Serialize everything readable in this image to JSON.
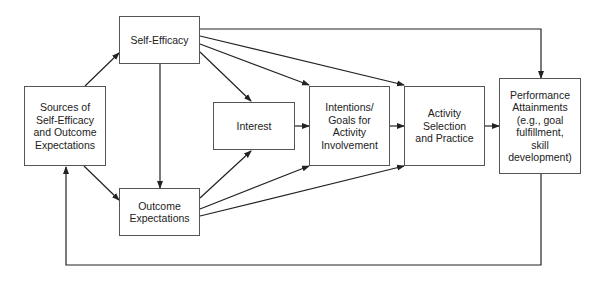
{
  "diagram": {
    "type": "flowchart",
    "colors": {
      "line": "#222222",
      "border": "#555555",
      "text": "#222222",
      "background": "#ffffff"
    },
    "nodes": {
      "sources": {
        "label": "Sources of\nSelf-Efficacy\nand Outcome\nExpectations"
      },
      "self_efficacy": {
        "label": "Self-Efficacy"
      },
      "outcome_expectations": {
        "label": "Outcome\nExpectations"
      },
      "interest": {
        "label": "Interest"
      },
      "intentions": {
        "label": "Intentions/\nGoals for\nActivity\nInvolvement"
      },
      "activity": {
        "label": "Activity\nSelection\nand Practice"
      },
      "performance": {
        "label": "Performance\nAttainments\n(e.g., goal\nfulfillment,\nskill\ndevelopment)"
      }
    },
    "edges": [
      {
        "from": "Sources of Self-Efficacy and Outcome Expectations",
        "to": "Self-Efficacy"
      },
      {
        "from": "Sources of Self-Efficacy and Outcome Expectations",
        "to": "Outcome Expectations"
      },
      {
        "from": "Self-Efficacy",
        "to": "Outcome Expectations"
      },
      {
        "from": "Self-Efficacy",
        "to": "Interest"
      },
      {
        "from": "Self-Efficacy",
        "to": "Intentions/Goals for Activity Involvement"
      },
      {
        "from": "Self-Efficacy",
        "to": "Activity Selection and Practice"
      },
      {
        "from": "Self-Efficacy",
        "to": "Performance Attainments"
      },
      {
        "from": "Outcome Expectations",
        "to": "Interest"
      },
      {
        "from": "Outcome Expectations",
        "to": "Intentions/Goals for Activity Involvement"
      },
      {
        "from": "Outcome Expectations",
        "to": "Activity Selection and Practice"
      },
      {
        "from": "Interest",
        "to": "Intentions/Goals for Activity Involvement"
      },
      {
        "from": "Intentions/Goals for Activity Involvement",
        "to": "Activity Selection and Practice"
      },
      {
        "from": "Activity Selection and Practice",
        "to": "Performance Attainments"
      },
      {
        "from": "Performance Attainments",
        "to": "Sources of Self-Efficacy and Outcome Expectations",
        "note": "feedback loop"
      }
    ]
  }
}
